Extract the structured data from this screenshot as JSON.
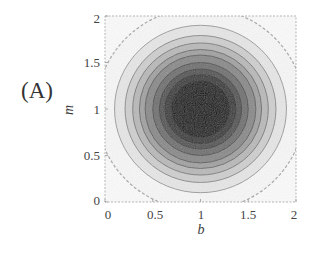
{
  "panel": {
    "label": "(A)"
  },
  "chart_data": {
    "type": "contour",
    "title": "",
    "panel_label": "(A)",
    "xlabel": "b",
    "ylabel": "m",
    "xlim": [
      0,
      2
    ],
    "ylim": [
      0,
      2
    ],
    "x_ticks": [
      "0",
      "0.5",
      "1",
      "1.5",
      "2"
    ],
    "y_ticks": [
      "0",
      "0.5",
      "1",
      "1.5",
      "2"
    ],
    "grid": false,
    "legend": null,
    "colormap": "grayscale (dark = high)",
    "center": {
      "b": 1.0,
      "m": 1.0
    },
    "contour_levels": [
      {
        "radius": 1.09,
        "fill": "#f7f7f7",
        "stroke": "#a8a8a8",
        "dashed": true
      },
      {
        "radius": 0.9,
        "fill": "#e6e6e6",
        "stroke": "#8a8a8a",
        "dashed": false
      },
      {
        "radius": 0.79,
        "fill": "#cfcfcf",
        "stroke": "#7a7a7a",
        "dashed": false
      },
      {
        "radius": 0.71,
        "fill": "#b9b9b9",
        "stroke": "#6e6e6e",
        "dashed": false
      },
      {
        "radius": 0.64,
        "fill": "#a2a2a2",
        "stroke": "#606060",
        "dashed": false
      },
      {
        "radius": 0.58,
        "fill": "#8a8a8a",
        "stroke": "#545454",
        "dashed": false
      },
      {
        "radius": 0.5,
        "fill": "#717171",
        "stroke": "#474747",
        "dashed": false
      },
      {
        "radius": 0.43,
        "fill": "#555555",
        "stroke": "#3a3a3a",
        "dashed": false
      },
      {
        "radius": 0.37,
        "fill": "#3a3a3a",
        "stroke": "#2a2a2a",
        "dashed": false
      },
      {
        "radius": 0.3,
        "fill": "#1f1f1f",
        "stroke": "#1a1a1a",
        "dashed": false
      },
      {
        "radius": 0.2,
        "fill": "#141414",
        "stroke": "#141414",
        "dashed": false
      }
    ],
    "background_fill": "#fbfbfb",
    "frame_color": "#b5b5b5"
  }
}
